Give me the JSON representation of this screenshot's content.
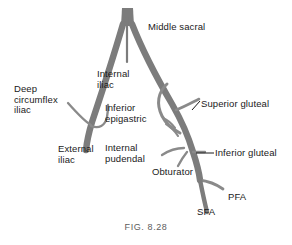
{
  "figure": {
    "caption": "FIG. 8.28",
    "background_color": "#ffffff",
    "vessel_color": "#7c7c7c",
    "branch_color": "#8a8a8a",
    "label_color": "#1a1a1a",
    "caption_color": "#5d5d5d"
  },
  "labels": {
    "middle_sacral": "Middle sacral",
    "deep_circumflex_iliac": "Deep\ncircumflex\niliac",
    "internal_iliac": "Internal\niliac",
    "inferior_epigastric": "Inferior\nepigastric",
    "external_iliac": "External\niliac",
    "internal_pudendal": "Internal\npudendal",
    "superior_gluteal": "Superior gluteal",
    "inferior_gluteal": "Inferior gluteal",
    "obturator": "Obturator",
    "pfa": "PFA",
    "sfa": "SFA"
  },
  "diagram_data": {
    "type": "anatomical-schematic",
    "subject": "Arterial anatomy of the aortic bifurcation, iliac and femoral arteries",
    "vessels": [
      {
        "name": "aorta",
        "label": null,
        "role": "trunk"
      },
      {
        "name": "middle-sacral-artery",
        "label": "Middle sacral",
        "role": "midline-branch"
      },
      {
        "name": "left-common-iliac",
        "label": null,
        "role": "limb"
      },
      {
        "name": "right-common-iliac",
        "label": null,
        "role": "limb"
      },
      {
        "name": "external-iliac-artery",
        "label": "External iliac",
        "role": "limb"
      },
      {
        "name": "deep-circumflex-iliac-artery",
        "label": "Deep circumflex iliac",
        "role": "branch"
      },
      {
        "name": "inferior-epigastric-artery",
        "label": "Inferior epigastric",
        "role": "branch"
      },
      {
        "name": "internal-iliac-artery",
        "label": "Internal iliac",
        "role": "branch"
      },
      {
        "name": "superior-gluteal-artery",
        "label": "Superior gluteal",
        "role": "branch"
      },
      {
        "name": "inferior-gluteal-artery",
        "label": "Inferior gluteal",
        "role": "branch"
      },
      {
        "name": "internal-pudendal-artery",
        "label": "Internal pudendal",
        "role": "branch"
      },
      {
        "name": "obturator-artery",
        "label": "Obturator",
        "role": "branch"
      },
      {
        "name": "profunda-femoris-artery",
        "label": "PFA",
        "role": "branch"
      },
      {
        "name": "superficial-femoral-artery",
        "label": "SFA",
        "role": "branch"
      }
    ],
    "leader_lines": [
      "superior-gluteal",
      "inferior-gluteal"
    ]
  }
}
